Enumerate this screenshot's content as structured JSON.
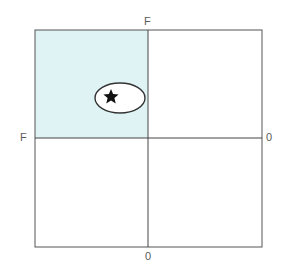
{
  "diagram": {
    "type": "quadrant-grid",
    "axis_labels": {
      "top": "F",
      "left": "F",
      "right": "0",
      "bottom": "0"
    },
    "shaded_quadrant": "top-left",
    "colors": {
      "shade_fill": "#dff3f5",
      "line": "#555555",
      "label_text": "#5a5a5a",
      "star": "#111111"
    },
    "marker": {
      "shape": "ellipse-with-star",
      "quadrant": "top-left"
    }
  }
}
